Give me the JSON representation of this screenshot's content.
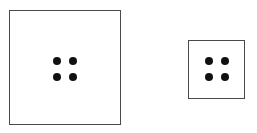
{
  "diagram": {
    "boxes": [
      {
        "id": "large",
        "x": 9,
        "y": 10,
        "w": 112,
        "h": 115,
        "dots": 4
      },
      {
        "id": "small",
        "x": 188,
        "y": 40,
        "w": 57,
        "h": 59,
        "dots": 4
      }
    ],
    "colors": {
      "border": "#4a4a4a",
      "dot": "#111111",
      "background": "#ffffff"
    }
  }
}
